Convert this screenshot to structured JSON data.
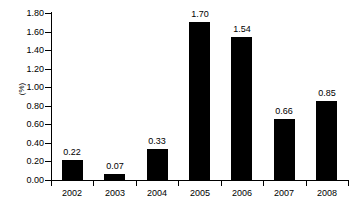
{
  "chart_data": {
    "type": "bar",
    "title": "",
    "subtitle": "",
    "xlabel": "",
    "ylabel": "(%)",
    "categories": [
      "2002",
      "2003",
      "2004",
      "2005",
      "2006",
      "2007",
      "2008"
    ],
    "values": [
      0.22,
      0.07,
      0.33,
      1.7,
      1.54,
      0.66,
      0.85
    ],
    "value_labels": [
      "0.22",
      "0.07",
      "0.33",
      "1.70",
      "1.54",
      "0.66",
      "0.85"
    ],
    "series": [
      {
        "name": "",
        "values": [
          0.22,
          0.07,
          0.33,
          1.7,
          1.54,
          0.66,
          0.85
        ]
      }
    ],
    "ylim": [
      0.0,
      1.8
    ],
    "ytick_values": [
      0.0,
      0.2,
      0.4,
      0.6,
      0.8,
      1.0,
      1.2,
      1.4,
      1.6,
      1.8
    ],
    "ytick_labels": [
      "0.00",
      "0.20",
      "0.40",
      "0.60",
      "0.80",
      "1.00",
      "1.20",
      "1.40",
      "1.60",
      "1.80"
    ],
    "grid": false,
    "legend": false,
    "legend_position": "none",
    "bar_color": "#000000",
    "background_color": "#ffffff",
    "data_labels_shown": true
  }
}
